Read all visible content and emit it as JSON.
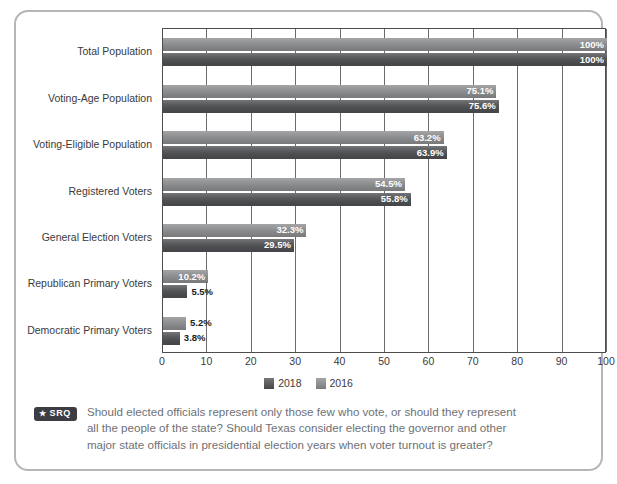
{
  "chart_data": {
    "type": "bar",
    "orientation": "horizontal",
    "title": "",
    "xlabel": "",
    "ylabel": "",
    "xlim": [
      0,
      100
    ],
    "xticks": [
      0,
      10,
      20,
      30,
      40,
      50,
      60,
      70,
      80,
      90,
      100
    ],
    "grid": true,
    "legend_position": "bottom-center",
    "categories": [
      "Total Population",
      "Voting-Age Population",
      "Voting-Eligible Population",
      "Registered Voters",
      "General Election Voters",
      "Republican Primary Voters",
      "Democratic Primary Voters"
    ],
    "series": [
      {
        "name": "2016",
        "color": "#8b8c8e",
        "values": [
          100,
          75.1,
          63.2,
          54.5,
          32.3,
          10.2,
          5.2
        ],
        "labels": [
          "100%",
          "75.1%",
          "63.2%",
          "54.5%",
          "32.3%",
          "10.2%",
          "5.2%"
        ],
        "label_outside": [
          false,
          false,
          false,
          false,
          false,
          false,
          true
        ]
      },
      {
        "name": "2018",
        "color": "#4f5053",
        "values": [
          100,
          75.6,
          63.9,
          55.8,
          29.5,
          5.5,
          3.8
        ],
        "labels": [
          "100%",
          "75.6%",
          "63.9%",
          "55.8%",
          "29.5%",
          "5.5%",
          "3.8%"
        ],
        "label_outside": [
          false,
          false,
          false,
          false,
          false,
          true,
          true
        ]
      }
    ]
  },
  "legend": {
    "items": [
      {
        "label": "2018",
        "color": "#4f5053"
      },
      {
        "label": "2016",
        "color": "#8b8c8e"
      }
    ]
  },
  "srq": {
    "badge_star": "★",
    "badge_label": "SRQ",
    "question": "Should elected officials represent only those few who vote, or should they represent all the people of the state? Should Texas consider electing the governor and other major state officials in presidential election years when voter turnout is greater?"
  }
}
